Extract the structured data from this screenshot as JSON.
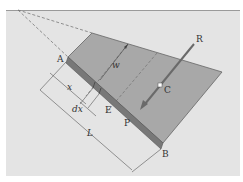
{
  "figure": {
    "background": "#e4e4e4",
    "plate_color": "#a8a8a8",
    "strip_color": "#787878",
    "line_color": "#555555",
    "labels": {
      "A": "A",
      "B": "B",
      "C": "C",
      "E": "E",
      "P": "P",
      "R": "R",
      "w": "w",
      "x": "x",
      "dx": "dx",
      "L": "L"
    }
  }
}
